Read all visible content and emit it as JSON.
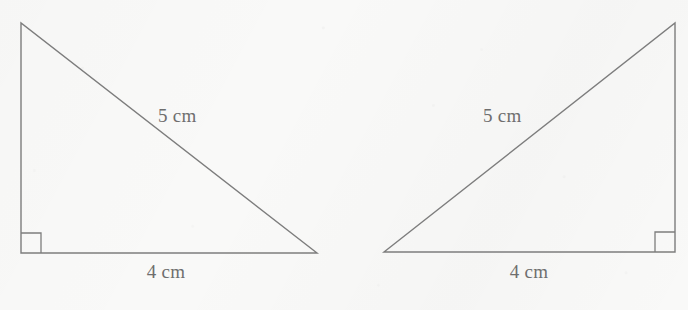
{
  "figure": {
    "stroke_color": "#7d7d7d",
    "background_color": "#f9f9f8",
    "text_color": "#6e6e6e",
    "shapes": [
      {
        "name": "left-triangle",
        "orientation": "right-angle-at-bottom-left",
        "vertices": [
          [
            21,
            23
          ],
          [
            21,
            253
          ],
          [
            317,
            253
          ]
        ],
        "right_angle_marker": {
          "x": 21,
          "y": 253,
          "size": 20,
          "corner": "bottom-left"
        },
        "labels": {
          "hypotenuse": "5 cm",
          "base": "4 cm"
        }
      },
      {
        "name": "right-triangle",
        "orientation": "right-angle-at-bottom-right",
        "vertices": [
          [
            675,
            23
          ],
          [
            675,
            252
          ],
          [
            384,
            252
          ]
        ],
        "right_angle_marker": {
          "x": 675,
          "y": 252,
          "size": 20,
          "corner": "bottom-right"
        },
        "labels": {
          "hypotenuse": "5 cm",
          "base": "4 cm"
        }
      }
    ]
  },
  "labels": {
    "left_hypotenuse": "5 cm",
    "left_base": "4 cm",
    "right_hypotenuse": "5 cm",
    "right_base": "4 cm"
  }
}
